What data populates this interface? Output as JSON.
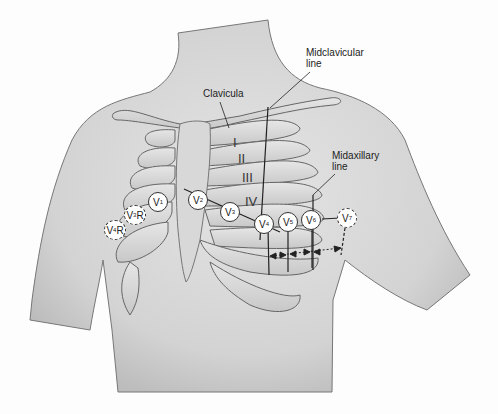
{
  "labels": {
    "clavicula": "Clavicula",
    "midclavicular_line": "Midclavicular line",
    "midaxillary_line": "Midaxillary line"
  },
  "intercostal_spaces": [
    "I",
    "II",
    "III",
    "IV"
  ],
  "leads": [
    {
      "id": "V1",
      "base": "V",
      "sub": "1",
      "suffix": "",
      "x": 158,
      "y": 192,
      "dashed": false
    },
    {
      "id": "V2",
      "base": "V",
      "sub": "2",
      "suffix": "",
      "x": 192,
      "y": 192,
      "dashed": false
    },
    {
      "id": "V3",
      "base": "V",
      "sub": "3",
      "suffix": "",
      "x": 224,
      "y": 204,
      "dashed": false
    },
    {
      "id": "V4",
      "base": "V",
      "sub": "4",
      "suffix": "",
      "x": 255,
      "y": 216,
      "dashed": false
    },
    {
      "id": "V5",
      "base": "V",
      "sub": "5",
      "suffix": "",
      "x": 280,
      "y": 213,
      "dashed": false
    },
    {
      "id": "V6",
      "base": "V",
      "sub": "6",
      "suffix": "",
      "x": 302,
      "y": 211,
      "dashed": false
    },
    {
      "id": "V7",
      "base": "V",
      "sub": "7",
      "suffix": "",
      "x": 338,
      "y": 210,
      "dashed": true
    },
    {
      "id": "V3R",
      "base": "V",
      "sub": "3",
      "suffix": "R",
      "x": 125,
      "y": 207,
      "dashed": true
    },
    {
      "id": "V4R",
      "base": "V",
      "sub": "4",
      "suffix": "R",
      "x": 107,
      "y": 220,
      "dashed": true
    }
  ]
}
